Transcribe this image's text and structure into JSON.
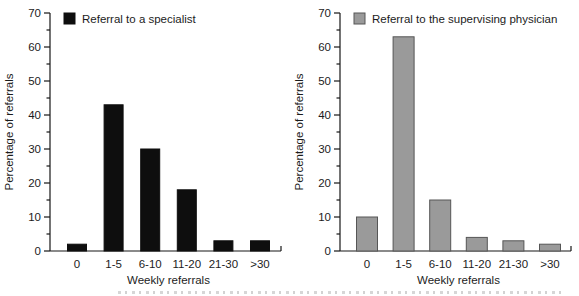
{
  "figure": {
    "background": "#ffffff",
    "text_color": "#1c1c1c",
    "axis_color": "#161616"
  },
  "chart_data": [
    {
      "type": "bar",
      "legend": "Referral to a specialist",
      "legend_position": "top-left",
      "categories": [
        "0",
        "1-5",
        "6-10",
        "11-20",
        "21-30",
        ">30"
      ],
      "values": [
        2,
        43,
        30,
        18,
        3,
        3
      ],
      "xlabel": "Weekly referrals",
      "ylabel": "Percentage of referrals",
      "ylim": [
        0,
        70
      ],
      "ytick_step": 10,
      "minor_tick_step": 5,
      "yticks": [
        "0",
        "10",
        "20",
        "30",
        "40",
        "50",
        "60",
        "70"
      ],
      "grid": false,
      "bar_color": "#0e0e0e",
      "bar_border": "#0e0e0e",
      "bar_width": 19
    },
    {
      "type": "bar",
      "legend": "Referral to the supervising physician",
      "legend_position": "top-left",
      "categories": [
        "0",
        "1-5",
        "6-10",
        "11-20",
        "21-30",
        ">30"
      ],
      "values": [
        10,
        63,
        15,
        4,
        3,
        2
      ],
      "xlabel": "Weekly referrals",
      "ylabel": "Percentage of referrals",
      "ylim": [
        0,
        70
      ],
      "ytick_step": 10,
      "minor_tick_step": 5,
      "yticks": [
        "0",
        "10",
        "20",
        "30",
        "40",
        "50",
        "60",
        "70"
      ],
      "grid": false,
      "bar_color": "#9a9a9a",
      "bar_border": "#565656",
      "bar_width": 21
    }
  ]
}
